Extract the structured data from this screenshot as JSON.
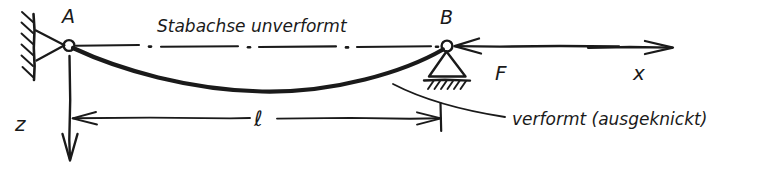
{
  "figure": {
    "type": "engineering-sketch",
    "labels": {
      "node_a": "A",
      "node_b": "B",
      "axis_x": "x",
      "axis_z": "z",
      "force": "F",
      "length": "ℓ",
      "undeformed_axis": "Stabachse unverformt",
      "deformed_note": "verformt (ausgeknickt)"
    },
    "colors": {
      "ink": "#1a1a1a",
      "background": "#ffffff"
    },
    "elements": {
      "support_a": "pinned-support",
      "support_b": "roller-support",
      "undeformed_line_style": "dash-dot",
      "deformed_line_style": "solid-thick-curve",
      "force_direction": "leftward",
      "x_axis_direction": "rightward",
      "z_axis_direction": "downward"
    }
  }
}
